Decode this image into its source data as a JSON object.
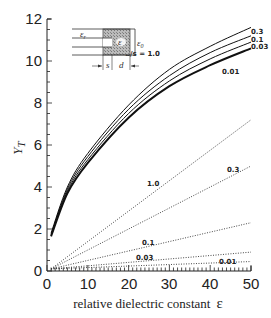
{
  "chart_data": {
    "type": "line",
    "title": "",
    "xlabel": "relative dielectric constant ε",
    "ylabel": "Y_T",
    "xlim": [
      0,
      50
    ],
    "ylim": [
      0,
      12
    ],
    "x_ticks": [
      0,
      10,
      20,
      30,
      40,
      50
    ],
    "y_ticks": [
      0,
      2,
      4,
      6,
      8,
      10,
      12
    ],
    "grid": false,
    "legend": "inline curve labels",
    "parameter": "d/s",
    "solid_series": [
      {
        "name": "0.3",
        "x": [
          1,
          5,
          10,
          20,
          30,
          40,
          50
        ],
        "values": [
          1.8,
          4.0,
          5.6,
          7.9,
          9.6,
          10.7,
          11.6
        ]
      },
      {
        "name": "0.1",
        "x": [
          1,
          5,
          10,
          20,
          30,
          40,
          50
        ],
        "values": [
          1.75,
          3.9,
          5.45,
          7.7,
          9.3,
          10.4,
          11.2
        ]
      },
      {
        "name": "0.03",
        "x": [
          1,
          5,
          10,
          20,
          30,
          40,
          50
        ],
        "values": [
          1.7,
          3.8,
          5.3,
          7.5,
          9.05,
          10.1,
          10.9
        ]
      },
      {
        "name": "0.01",
        "x": [
          1,
          5,
          10,
          20,
          30,
          40,
          50
        ],
        "values": [
          1.65,
          3.7,
          5.15,
          7.3,
          8.8,
          9.8,
          10.6
        ]
      }
    ],
    "dotted_series": [
      {
        "name": "1.0",
        "x": [
          1,
          50
        ],
        "values": [
          0.1,
          7.2
        ]
      },
      {
        "name": "0.3",
        "x": [
          1,
          50
        ],
        "values": [
          0.1,
          5.0
        ]
      },
      {
        "name": "0.1",
        "x": [
          1,
          50
        ],
        "values": [
          0.1,
          2.3
        ]
      },
      {
        "name": "0.03",
        "x": [
          1,
          50
        ],
        "values": [
          0.1,
          0.9
        ]
      },
      {
        "name": "0.01",
        "x": [
          1,
          50
        ],
        "values": [
          0.1,
          0.45
        ]
      }
    ],
    "annotations": [
      "d/s = 1.0",
      "0.3",
      "0.1",
      "0.03",
      "0.01",
      "1.0",
      "0.3",
      "0.1",
      "0.03",
      "0.01"
    ],
    "inset": {
      "labels": [
        "ε_r",
        "ε",
        "ε_0",
        "s",
        "d"
      ]
    }
  },
  "labels": {
    "xlabel": "relative dielectric constant",
    "xlabel_symbol": "ε",
    "ylabel_main": "Y",
    "ylabel_sub": "T",
    "ds_label": "d/s = 1.0",
    "solid": [
      "0.3",
      "0.1",
      "0.03",
      "0.01"
    ],
    "dotted": [
      "1.0",
      "0.3",
      "0.1",
      "0.03",
      "0.01"
    ],
    "x_ticks": [
      "0",
      "10",
      "20",
      "30",
      "40",
      "50"
    ],
    "y_ticks": [
      "0",
      "2",
      "4",
      "6",
      "8",
      "10",
      "12"
    ],
    "inset_er": "ε",
    "inset_er_sub": "r",
    "inset_e": "ε",
    "inset_e0": "ε",
    "inset_e0_sub": "0",
    "inset_s": "s",
    "inset_d": "d"
  }
}
